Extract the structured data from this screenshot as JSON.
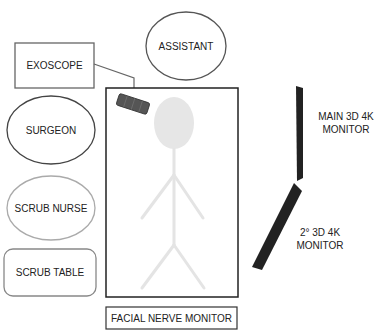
{
  "diagram": {
    "type": "operating-room-layout",
    "stations": {
      "exoscope": "EXOSCOPE",
      "assistant": "ASSISTANT",
      "surgeon": "SURGEON",
      "scrub_nurse": "SCRUB NURSE",
      "scrub_table": "SCRUB TABLE",
      "facial_nerve_monitor": "FACIAL NERVE MONITOR",
      "main_monitor_line1": "MAIN 3D 4K",
      "main_monitor_line2": "MONITOR",
      "second_monitor_line1": "2° 3D 4K",
      "second_monitor_line2": "MONITOR"
    },
    "colors": {
      "outline": "#555555",
      "table_outline": "#222222",
      "monitor_fill": "#222222",
      "exoscope_fill": "#555555",
      "patient_figure": "#e4e4e4",
      "scrub_nurse_outline": "#aaaaaa",
      "scrub_table_outline": "#888888"
    }
  }
}
